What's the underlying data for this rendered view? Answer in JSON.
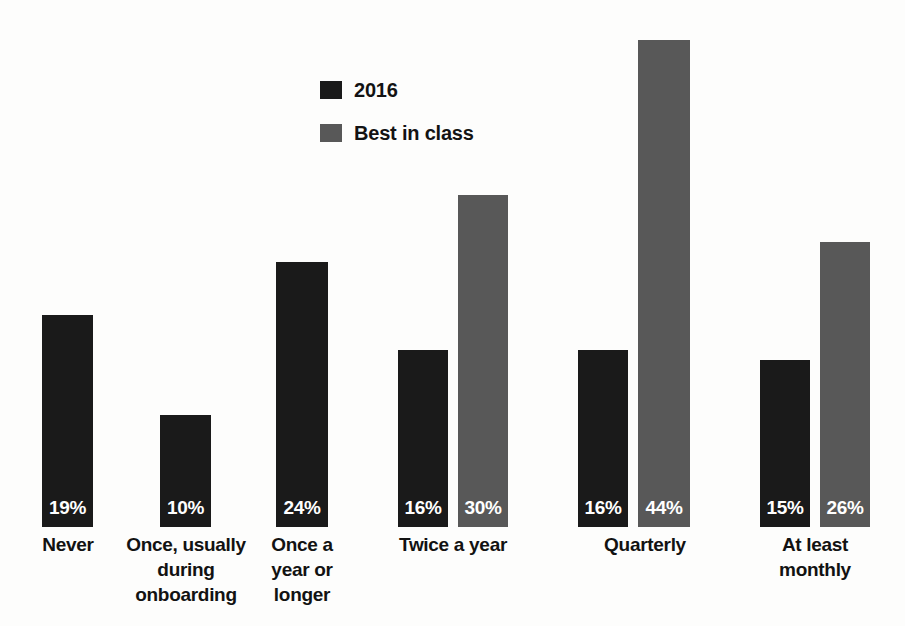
{
  "chart_data": {
    "type": "bar",
    "title": "",
    "subtitle": "",
    "xlabel": "",
    "ylabel": "",
    "grid": false,
    "legend_position": "top-center",
    "ylim": [
      0,
      47
    ],
    "categories": [
      "Never",
      "Once, usually during onboarding",
      "Once a year or longer",
      "Twice a year",
      "Quarterly",
      "At least monthly"
    ],
    "series": [
      {
        "name": "2016",
        "color": "#1a1a1a",
        "values": [
          19,
          10,
          24,
          16,
          16,
          15
        ],
        "labels": [
          "19%",
          "10%",
          "24%",
          "16%",
          "16%",
          "15%"
        ]
      },
      {
        "name": "Best in class",
        "color": "#585858",
        "values": [
          null,
          null,
          null,
          30,
          44,
          26
        ],
        "labels": [
          null,
          null,
          null,
          "30%",
          "44%",
          "26%"
        ]
      }
    ]
  },
  "legend": {
    "items": [
      {
        "label": "2016",
        "color": "#1a1a1a",
        "swatch_name": "legend-swatch-2016"
      },
      {
        "label": "Best in class",
        "color": "#585858",
        "swatch_name": "legend-swatch-best-in-class"
      }
    ]
  },
  "axis": {
    "categories": [
      {
        "lines": [
          "Never"
        ]
      },
      {
        "lines": [
          "Once, usually",
          "during",
          "onboarding"
        ]
      },
      {
        "lines": [
          "Once a",
          "year or",
          "longer"
        ]
      },
      {
        "lines": [
          "Twice a year"
        ]
      },
      {
        "lines": [
          "Quarterly"
        ]
      },
      {
        "lines": [
          "At least",
          "monthly"
        ]
      }
    ]
  },
  "bars": [
    {
      "name": "bar-never-2016",
      "value_label": "19%",
      "left": 42,
      "width": 51,
      "height": 212,
      "color": "#1a1a1a"
    },
    {
      "name": "bar-onboarding-2016",
      "value_label": "10%",
      "left": 160,
      "width": 51,
      "height": 112,
      "color": "#1a1a1a"
    },
    {
      "name": "bar-once-a-year-2016",
      "value_label": "24%",
      "left": 276,
      "width": 52,
      "height": 265,
      "color": "#1a1a1a"
    },
    {
      "name": "bar-twice-a-year-2016",
      "value_label": "16%",
      "left": 398,
      "width": 50,
      "height": 177,
      "color": "#1a1a1a"
    },
    {
      "name": "bar-twice-a-year-best",
      "value_label": "30%",
      "left": 458,
      "width": 50,
      "height": 332,
      "color": "#585858"
    },
    {
      "name": "bar-quarterly-2016",
      "value_label": "16%",
      "left": 578,
      "width": 50,
      "height": 177,
      "color": "#1a1a1a"
    },
    {
      "name": "bar-quarterly-best",
      "value_label": "44%",
      "left": 638,
      "width": 52,
      "height": 487,
      "color": "#585858"
    },
    {
      "name": "bar-at-least-monthly-2016",
      "value_label": "15%",
      "left": 760,
      "width": 50,
      "height": 167,
      "color": "#1a1a1a"
    },
    {
      "name": "bar-at-least-monthly-best",
      "value_label": "26%",
      "left": 820,
      "width": 50,
      "height": 285,
      "color": "#585858"
    }
  ],
  "cat_positions": [
    {
      "left": 17,
      "width": 102
    },
    {
      "left": 116,
      "width": 140
    },
    {
      "left": 250,
      "width": 104
    },
    {
      "left": 378,
      "width": 150
    },
    {
      "left": 565,
      "width": 160
    },
    {
      "left": 744,
      "width": 142
    }
  ]
}
